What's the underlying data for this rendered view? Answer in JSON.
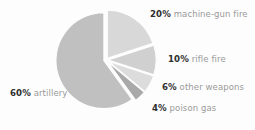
{
  "chart_data": {
    "type": "pie",
    "title": "",
    "subtitle": "",
    "xlabel": "",
    "ylabel": "",
    "legend_position": "callout-labels",
    "grid": false,
    "unit": "%",
    "categories": [
      "machine-gun fire",
      "rifle fire",
      "other weapons",
      "poison gas",
      "artillery"
    ],
    "values": [
      20,
      10,
      6,
      4,
      60
    ],
    "slices": [
      {
        "name": "machine-gun fire",
        "value": 20,
        "pct_label": "20%",
        "label": "machine-gun fire",
        "color": "#d8d8d8",
        "start_angle": 0,
        "end_angle": 72,
        "exploded": true
      },
      {
        "name": "rifle fire",
        "value": 10,
        "pct_label": "10%",
        "label": "rifle fire",
        "color": "#d0d0d0",
        "start_angle": 72,
        "end_angle": 108,
        "exploded": true
      },
      {
        "name": "other weapons",
        "value": 6,
        "pct_label": "6%",
        "label": "other weapons",
        "color": "#dcdcdc",
        "start_angle": 108,
        "end_angle": 129.6,
        "exploded": true
      },
      {
        "name": "poison gas",
        "value": 4,
        "pct_label": "4%",
        "label": "poison gas",
        "color": "#a9a9a9",
        "start_angle": 129.6,
        "end_angle": 144,
        "exploded": true
      },
      {
        "name": "artillery",
        "value": 60,
        "pct_label": "60%",
        "label": "artillery",
        "color": "#c0c0c0",
        "start_angle": 144,
        "end_angle": 360,
        "exploded": true
      }
    ]
  },
  "colors": {
    "background": "#fdfdfd",
    "percent_text": "#2e2e2e",
    "description_text": "#9a9a9a",
    "slice_artillery": "#c0c0c0",
    "slice_machine_gun": "#d8d8d8",
    "slice_rifle": "#d0d0d0",
    "slice_other": "#dcdcdc",
    "slice_poison_gas": "#a9a9a9"
  }
}
